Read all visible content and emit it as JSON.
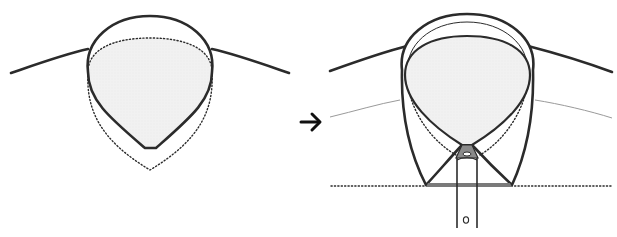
{
  "diagram": {
    "description": "Shirt collar fitting illustration: neck opening before and after collar is attached",
    "colors": {
      "stroke": "#2b2b2b",
      "fill": "#efefef",
      "thin_line": "#9a9a9a",
      "placket_fill": "#7a7a7a"
    },
    "panels": [
      {
        "id": "before",
        "label": ""
      },
      {
        "id": "after",
        "label": ""
      }
    ],
    "arrow": {
      "glyph": "→",
      "direction": "right"
    }
  }
}
